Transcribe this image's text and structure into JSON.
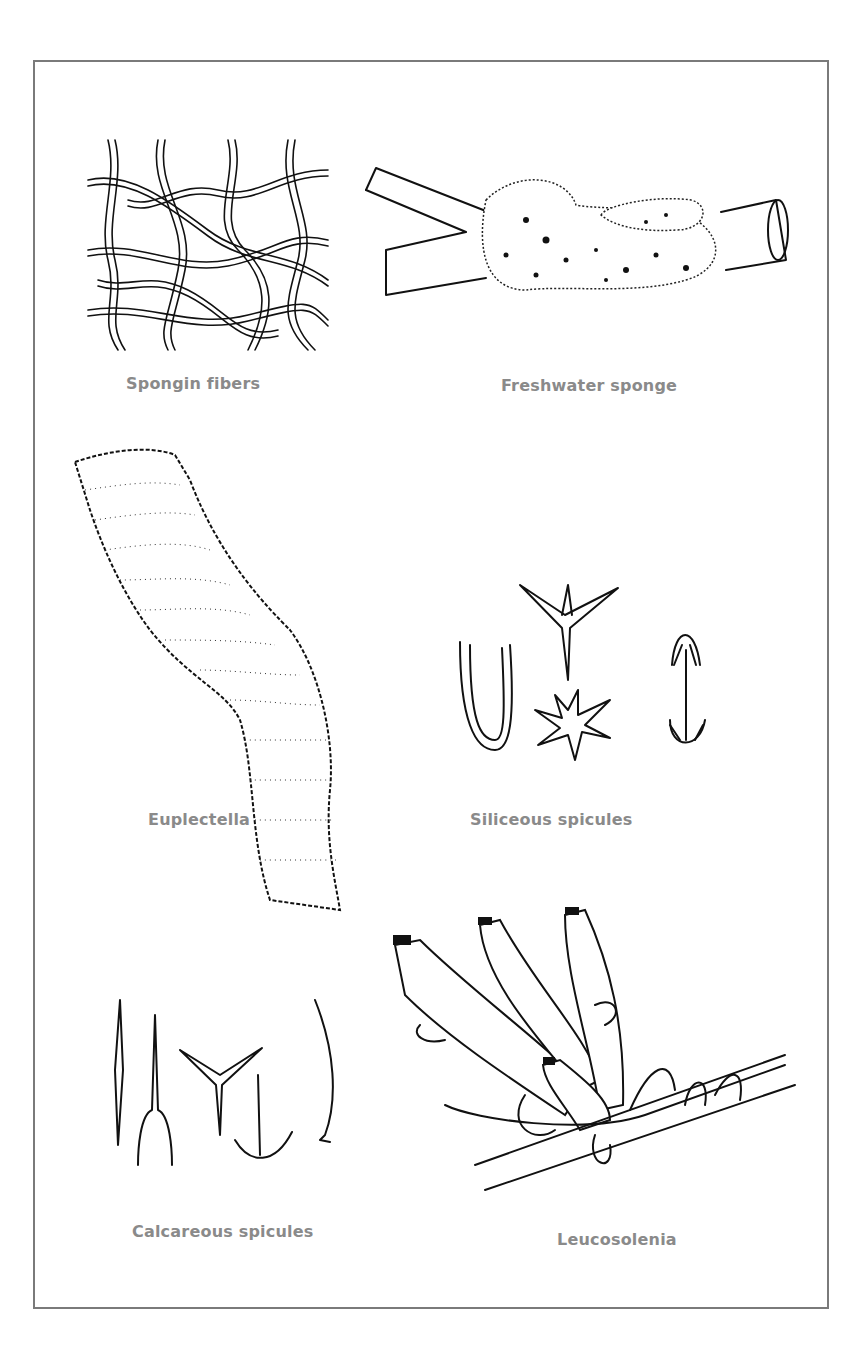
{
  "plate": {
    "border_color": "#7a7a7a",
    "caption_color": "#8a8a8a",
    "ink_color": "#111111",
    "figures": [
      {
        "id": "spongin-fibers",
        "caption": "Spongin fibers"
      },
      {
        "id": "freshwater-sponge",
        "caption": "Freshwater sponge"
      },
      {
        "id": "euplectella",
        "caption": "Euplectella"
      },
      {
        "id": "siliceous-spicules",
        "caption": "Siliceous spicules"
      },
      {
        "id": "calcareous-spicules",
        "caption": "Calcareous spicules"
      },
      {
        "id": "leucosolenia",
        "caption": "Leucosolenia"
      }
    ]
  }
}
